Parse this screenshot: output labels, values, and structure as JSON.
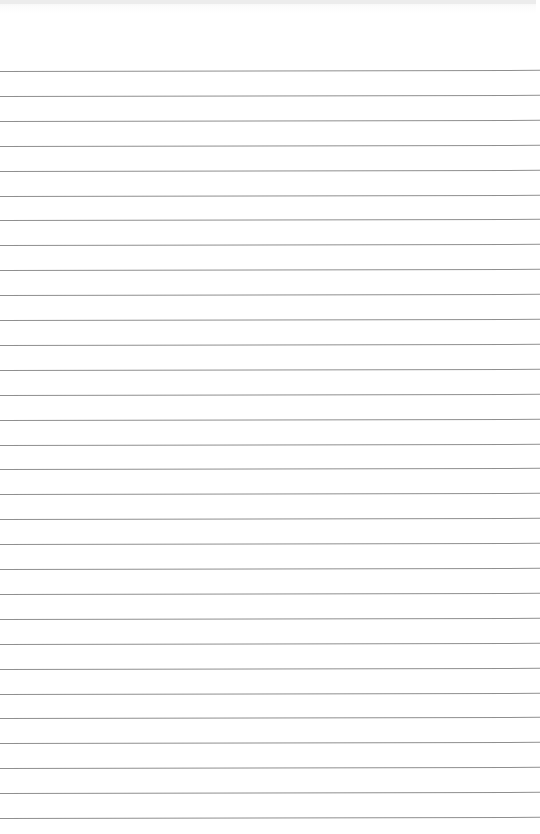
{
  "page": {
    "type": "blank ruled notepaper",
    "background_color": "#ffffff",
    "line_color": "#8f8f8f",
    "first_line_y": 71,
    "line_spacing": 24.9,
    "line_count": 31,
    "text": ""
  }
}
